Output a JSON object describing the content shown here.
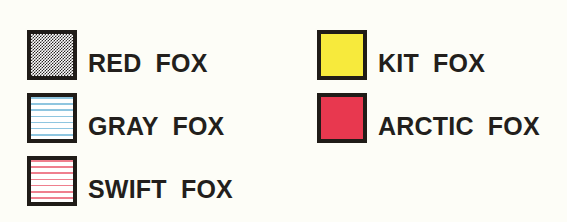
{
  "legend": {
    "title": "Fox Species Legend",
    "background_color": "#fdfdf7",
    "border_color": "#201c18",
    "text_color": "#231f1c",
    "columns": [
      {
        "name": "left-column",
        "entries": [
          {
            "label": "RED FOX",
            "swatch_name": "swatch-red-fox",
            "pattern": "stipple",
            "fill_color": "#ffffff",
            "pattern_color": "#2a2622"
          },
          {
            "label": "GRAY FOX",
            "swatch_name": "swatch-gray-fox",
            "pattern": "horizontal-lines",
            "fill_color": "#ffffff",
            "pattern_color": "#8fc6e0"
          },
          {
            "label": "SWIFT FOX",
            "swatch_name": "swatch-swift-fox",
            "pattern": "horizontal-lines",
            "fill_color": "#ffffff",
            "pattern_color": "#ef7f8e"
          }
        ]
      },
      {
        "name": "right-column",
        "entries": [
          {
            "label": "KIT FOX",
            "swatch_name": "swatch-kit-fox",
            "pattern": "solid",
            "fill_color": "#f7ea3c",
            "pattern_color": "#f7ea3c"
          },
          {
            "label": "ARCTIC FOX",
            "swatch_name": "swatch-arctic-fox",
            "pattern": "solid",
            "fill_color": "#e8384f",
            "pattern_color": "#e8384f"
          }
        ]
      }
    ]
  }
}
